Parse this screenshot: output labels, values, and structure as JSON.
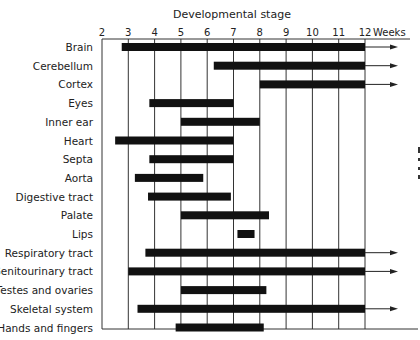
{
  "chart_data": {
    "type": "gantt",
    "title": "Developmental stage",
    "xlabel": "Weeks",
    "xlim": [
      2,
      12
    ],
    "x_ticks": [
      "2",
      "3",
      "4",
      "5",
      "6",
      "7",
      "8",
      "9",
      "10",
      "11",
      "12"
    ],
    "grid": "vertical",
    "rows": [
      {
        "label": "Brain",
        "start": 2.75,
        "end": 12,
        "continues": true
      },
      {
        "label": "Cerebellum",
        "start": 6.25,
        "end": 12,
        "continues": true
      },
      {
        "label": "Cortex",
        "start": 8,
        "end": 12,
        "continues": true
      },
      {
        "label": "Eyes",
        "start": 3.8,
        "end": 7,
        "continues": false
      },
      {
        "label": "Inner ear",
        "start": 5,
        "end": 8,
        "continues": false
      },
      {
        "label": "Heart",
        "start": 2.5,
        "end": 7,
        "continues": false
      },
      {
        "label": "Septa",
        "start": 3.8,
        "end": 7,
        "continues": false
      },
      {
        "label": "Aorta",
        "start": 3.25,
        "end": 5.85,
        "continues": false
      },
      {
        "label": "Digestive tract",
        "start": 3.75,
        "end": 6.9,
        "continues": false
      },
      {
        "label": "Palate",
        "start": 5,
        "end": 8.35,
        "continues": false
      },
      {
        "label": "Lips",
        "start": 7.15,
        "end": 7.8,
        "continues": false
      },
      {
        "label": "Respiratory tract",
        "start": 3.65,
        "end": 12,
        "continues": true
      },
      {
        "label": "Genitourinary tract",
        "start": 3,
        "end": 12,
        "continues": true
      },
      {
        "label": "Testes and ovaries",
        "start": 5,
        "end": 8.25,
        "continues": false
      },
      {
        "label": "Skeletal system",
        "start": 3.35,
        "end": 12,
        "continues": true
      },
      {
        "label": "Hands and fingers",
        "start": 4.8,
        "end": 8.15,
        "continues": false
      }
    ]
  }
}
